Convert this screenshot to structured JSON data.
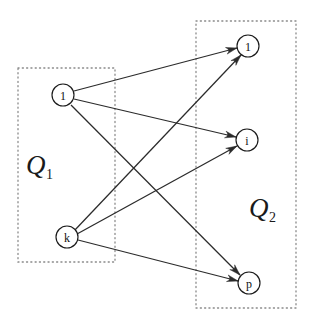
{
  "figure": {
    "background_color": "#ffffff",
    "width": 316,
    "height": 323
  },
  "style": {
    "node_stroke": "#1a1a1a",
    "node_fill": "#ffffff",
    "edge_color": "#2b2b2b",
    "box_stroke": "#8a8a8a",
    "label_color": "#1a1a1a"
  },
  "groups": [
    {
      "id": "Q1",
      "label_base": "Q",
      "label_sub": "1",
      "label_x": 26,
      "label_y": 152,
      "box": {
        "x": 18,
        "y": 68,
        "width": 97,
        "height": 194
      }
    },
    {
      "id": "Q2",
      "label_base": "Q",
      "label_sub": "2",
      "label_x": 249,
      "label_y": 195,
      "box": {
        "x": 196,
        "y": 21,
        "width": 100,
        "height": 287
      }
    }
  ],
  "nodes": [
    {
      "id": "q1-1",
      "label": "1",
      "group": "Q1",
      "cx": 63,
      "cy": 95,
      "r": 11
    },
    {
      "id": "q1-k",
      "label": "k",
      "group": "Q1",
      "cx": 67,
      "cy": 237,
      "r": 11
    },
    {
      "id": "q2-1",
      "label": "1",
      "group": "Q2",
      "cx": 248,
      "cy": 46,
      "r": 11
    },
    {
      "id": "q2-i",
      "label": "i",
      "group": "Q2",
      "cx": 247,
      "cy": 140,
      "r": 11
    },
    {
      "id": "q2-p",
      "label": "p",
      "group": "Q2",
      "cx": 249,
      "cy": 283,
      "r": 11
    }
  ],
  "edges": [
    {
      "id": "e1",
      "from": "q1-1",
      "to": "q2-1",
      "x1": 74,
      "y1": 91,
      "x2": 237,
      "y2": 48
    },
    {
      "id": "e2",
      "from": "q1-1",
      "to": "q2-i",
      "x1": 74,
      "y1": 99,
      "x2": 236,
      "y2": 137
    },
    {
      "id": "e3",
      "from": "q1-1",
      "to": "q2-p",
      "x1": 71,
      "y1": 105,
      "x2": 240,
      "y2": 275
    },
    {
      "id": "e4",
      "from": "q1-k",
      "to": "q2-1",
      "x1": 74,
      "y1": 231,
      "x2": 241,
      "y2": 55
    },
    {
      "id": "e5",
      "from": "q1-k",
      "to": "q2-i",
      "x1": 77,
      "y1": 234,
      "x2": 237,
      "y2": 146
    },
    {
      "id": "e6",
      "from": "q1-k",
      "to": "q2-p",
      "x1": 78,
      "y1": 240,
      "x2": 238,
      "y2": 281
    }
  ],
  "arrowhead": {
    "length": 11,
    "half_width": 3.4
  }
}
